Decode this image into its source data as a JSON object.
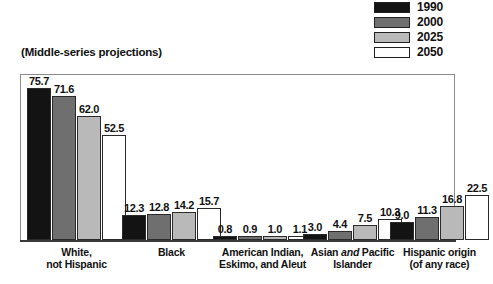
{
  "subtitle": "(Middle-series projections)",
  "legend": {
    "items": [
      {
        "label": "1990",
        "color": "#131313"
      },
      {
        "label": "2000",
        "color": "#6f6f6f"
      },
      {
        "label": "2025",
        "color": "#b9b9b9"
      },
      {
        "label": "2050",
        "color": "#ffffff"
      }
    ]
  },
  "chart_data": {
    "type": "bar",
    "title": "",
    "subtitle": "(Middle-series projections)",
    "xlabel": "",
    "ylabel": "",
    "ylim": [
      0,
      80
    ],
    "grid": false,
    "legend_position": "top-right",
    "categories": [
      "White, not Hispanic",
      "Black",
      "American Indian, Eskimo, and Aleut",
      "Asian and Pacific Islander",
      "Hispanic origin (of any race)"
    ],
    "category_lines": [
      [
        "White,",
        "not Hispanic"
      ],
      [
        "Black"
      ],
      [
        "American Indian,",
        "Eskimo, and Aleut"
      ],
      [
        "Asian and Pacific",
        "Islander"
      ],
      [
        "Hispanic origin",
        "(of any race)"
      ]
    ],
    "series": [
      {
        "name": "1990",
        "color": "#131313",
        "values": [
          75.7,
          12.3,
          0.8,
          3.0,
          9.0
        ]
      },
      {
        "name": "2000",
        "color": "#6f6f6f",
        "values": [
          71.6,
          12.8,
          0.9,
          4.4,
          11.3
        ]
      },
      {
        "name": "2025",
        "color": "#b9b9b9",
        "values": [
          62.0,
          14.2,
          1.0,
          7.5,
          16.8
        ]
      },
      {
        "name": "2050",
        "color": "#ffffff",
        "values": [
          52.5,
          15.7,
          1.1,
          10.3,
          22.5
        ]
      }
    ],
    "value_labels": [
      [
        "75.7",
        "71.6",
        "62.0",
        "52.5"
      ],
      [
        "12.3",
        "12.8",
        "14.2",
        "15.7"
      ],
      [
        "0.8",
        "0.9",
        "1.0",
        "1.1"
      ],
      [
        "3.0",
        "4.4",
        "7.5",
        "10.3"
      ],
      [
        "9.0",
        "11.3",
        "16.8",
        "22.5"
      ]
    ]
  }
}
